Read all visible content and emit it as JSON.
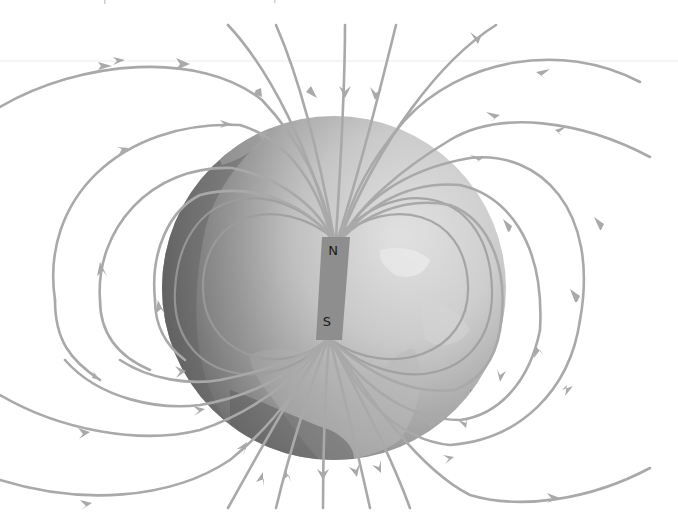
{
  "diagram": {
    "magnet": {
      "north_label": "N",
      "south_label": "S"
    },
    "colors": {
      "background": "#ffffff",
      "field_lines": "#a9a9a9",
      "globe_dark": "#5e5e5e",
      "globe_light": "#e2e2e2",
      "magnet": "#8e8e8e",
      "labels": "#1a1a1a"
    },
    "elements": {
      "globe": "Earth globe (grayscale) centered in image",
      "bar_magnet": "Tilted bar magnet inside the globe, N at top, S at bottom",
      "field_lines": "Curved field lines emerging from the S pole region at bottom, looping around the globe, and converging into the N pole region at top, with arrowheads showing direction"
    }
  }
}
